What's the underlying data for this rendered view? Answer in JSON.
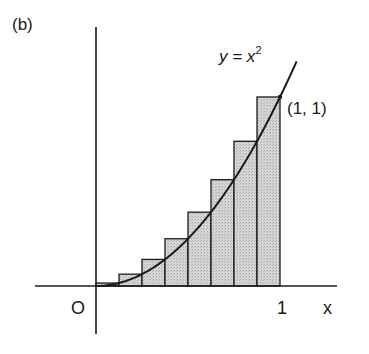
{
  "figure": {
    "panel_label": "(b)",
    "curve_label": "y = x",
    "curve_label_exponent": "2",
    "point_label": "(1, 1)",
    "origin_label": "O",
    "x_tick_label": "1",
    "x_axis_label": "x",
    "colors": {
      "ink": "#1a1a1a",
      "bar_fill": "#cfcfcf",
      "background": "#ffffff"
    }
  },
  "chart_data": {
    "type": "bar",
    "title": "(b)",
    "function": "y = x^2",
    "xlabel": "x",
    "ylabel": "",
    "xlim": [
      0,
      1
    ],
    "ylim": [
      0,
      1
    ],
    "annotations": [
      "y = x²",
      "(1, 1)",
      "O",
      "1"
    ],
    "categories": [
      "0–1/8",
      "1/8–2/8",
      "2/8–3/8",
      "3/8–4/8",
      "4/8–5/8",
      "5/8–6/8",
      "6/8–7/8",
      "7/8–1"
    ],
    "values": [
      0.0156,
      0.0625,
      0.1406,
      0.25,
      0.3906,
      0.5625,
      0.7656,
      1.0
    ],
    "grid": false,
    "legend": "none"
  }
}
